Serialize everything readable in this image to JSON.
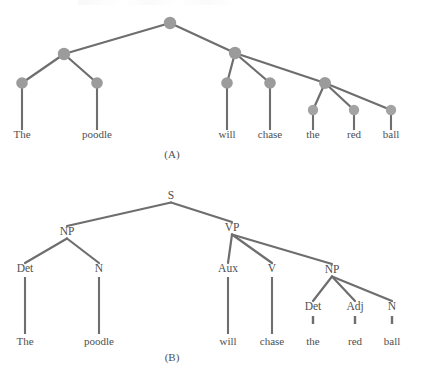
{
  "figure": {
    "caption_a": "(A)",
    "caption_b": "(B)",
    "sentence_words": [
      "The",
      "poodle",
      "will",
      "chase",
      "the",
      "red",
      "ball"
    ],
    "colors": {
      "node": "#9b9b9b",
      "edge": "#6e6e6e",
      "text": "#4f4f4f",
      "background": "#ffffff"
    }
  },
  "chart_data": {
    "type": "diagram",
    "diagram_kind": "syntactic-parse-tree-pair",
    "title": "",
    "panels": [
      {
        "id": "A",
        "caption": "(A)",
        "label_style": "unlabeled-nodes",
        "nodes": [
          {
            "id": "a-s",
            "label": "",
            "x": 170,
            "y": 23,
            "r": 6.2
          },
          {
            "id": "a-np1",
            "label": "",
            "x": 64,
            "y": 54,
            "r": 6.2
          },
          {
            "id": "a-vp",
            "label": "",
            "x": 235,
            "y": 53,
            "r": 6.2
          },
          {
            "id": "a-det1",
            "label": "",
            "x": 22,
            "y": 83,
            "r": 5.8
          },
          {
            "id": "a-n1",
            "label": "",
            "x": 97,
            "y": 83,
            "r": 5.8
          },
          {
            "id": "a-aux",
            "label": "",
            "x": 227,
            "y": 83,
            "r": 5.8
          },
          {
            "id": "a-v",
            "label": "",
            "x": 270,
            "y": 83,
            "r": 5.8
          },
          {
            "id": "a-np2",
            "label": "",
            "x": 325,
            "y": 83,
            "r": 6.0
          },
          {
            "id": "a-det2",
            "label": "",
            "x": 313,
            "y": 110,
            "r": 5.2
          },
          {
            "id": "a-adj",
            "label": "",
            "x": 354,
            "y": 110,
            "r": 5.2
          },
          {
            "id": "a-n2",
            "label": "",
            "x": 391,
            "y": 110,
            "r": 5.2
          }
        ],
        "edges": [
          [
            "a-s",
            "a-np1"
          ],
          [
            "a-s",
            "a-vp"
          ],
          [
            "a-np1",
            "a-det1"
          ],
          [
            "a-np1",
            "a-n1"
          ],
          [
            "a-vp",
            "a-aux"
          ],
          [
            "a-vp",
            "a-v"
          ],
          [
            "a-vp",
            "a-np2"
          ],
          [
            "a-np2",
            "a-det2"
          ],
          [
            "a-np2",
            "a-adj"
          ],
          [
            "a-np2",
            "a-n2"
          ]
        ],
        "leaves": [
          {
            "word": "The",
            "x": 22,
            "y": 138,
            "stem_from_node": "a-det1"
          },
          {
            "word": "poodle",
            "x": 97,
            "y": 138,
            "stem_from_node": "a-n1"
          },
          {
            "word": "will",
            "x": 227,
            "y": 138,
            "stem_from_node": "a-aux"
          },
          {
            "word": "chase",
            "x": 270,
            "y": 138,
            "stem_from_node": "a-v"
          },
          {
            "word": "the",
            "x": 313,
            "y": 138,
            "stem_from_node": "a-det2"
          },
          {
            "word": "red",
            "x": 354,
            "y": 138,
            "stem_from_node": "a-adj"
          },
          {
            "word": "ball",
            "x": 391,
            "y": 138,
            "stem_from_node": "a-n2"
          }
        ],
        "caption_pos": {
          "x": 172,
          "y": 158
        }
      },
      {
        "id": "B",
        "caption": "(B)",
        "label_style": "labeled-categories",
        "nodes": [
          {
            "id": "b-s",
            "label": "S",
            "x": 171,
            "y": 199
          },
          {
            "id": "b-np1",
            "label": "NP",
            "x": 67,
            "y": 235
          },
          {
            "id": "b-vp",
            "label": "VP",
            "x": 232,
            "y": 231
          },
          {
            "id": "b-det1",
            "label": "Det",
            "x": 25,
            "y": 272
          },
          {
            "id": "b-n1",
            "label": "N",
            "x": 99,
            "y": 272
          },
          {
            "id": "b-aux",
            "label": "Aux",
            "x": 228,
            "y": 272
          },
          {
            "id": "b-v",
            "label": "V",
            "x": 272,
            "y": 272
          },
          {
            "id": "b-np2",
            "label": "NP",
            "x": 332,
            "y": 273
          },
          {
            "id": "b-det2",
            "label": "Det",
            "x": 313,
            "y": 310
          },
          {
            "id": "b-adj",
            "label": "Adj",
            "x": 355,
            "y": 310
          },
          {
            "id": "b-n2",
            "label": "N",
            "x": 392,
            "y": 310
          }
        ],
        "edges": [
          [
            "b-s",
            "b-np1"
          ],
          [
            "b-s",
            "b-vp"
          ],
          [
            "b-np1",
            "b-det1"
          ],
          [
            "b-np1",
            "b-n1"
          ],
          [
            "b-vp",
            "b-aux"
          ],
          [
            "b-vp",
            "b-v"
          ],
          [
            "b-vp",
            "b-np2"
          ],
          [
            "b-np2",
            "b-det2"
          ],
          [
            "b-np2",
            "b-adj"
          ],
          [
            "b-np2",
            "b-n2"
          ]
        ],
        "leaves": [
          {
            "word": "The",
            "x": 25,
            "y": 345,
            "stem_from_node": "b-det1",
            "stem_style": "long"
          },
          {
            "word": "poodle",
            "x": 99,
            "y": 345,
            "stem_from_node": "b-n1",
            "stem_style": "long"
          },
          {
            "word": "will",
            "x": 228,
            "y": 345,
            "stem_from_node": "b-aux",
            "stem_style": "long"
          },
          {
            "word": "chase",
            "x": 272,
            "y": 345,
            "stem_from_node": "b-v",
            "stem_style": "long"
          },
          {
            "word": "the",
            "x": 313,
            "y": 345,
            "stem_from_node": "b-det2",
            "stem_style": "tick"
          },
          {
            "word": "red",
            "x": 355,
            "y": 345,
            "stem_from_node": "b-adj",
            "stem_style": "tick"
          },
          {
            "word": "ball",
            "x": 392,
            "y": 345,
            "stem_from_node": "b-n2",
            "stem_style": "tick"
          }
        ],
        "caption_pos": {
          "x": 172,
          "y": 361
        }
      }
    ]
  }
}
